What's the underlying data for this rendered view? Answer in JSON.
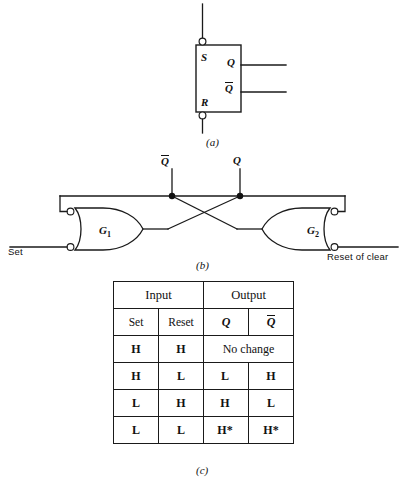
{
  "figure": {
    "panels": [
      {
        "id": "a",
        "caption": "(a)",
        "description": "SR flip-flop logic symbol"
      },
      {
        "id": "b",
        "caption": "(b)",
        "description": "Cross-coupled gate realization"
      },
      {
        "id": "c",
        "caption": "(c)",
        "description": "Truth table"
      }
    ]
  },
  "symbol": {
    "input_s": "S",
    "input_r": "R",
    "output_q": "Q",
    "output_qbar": "Q",
    "output_qbar_overbar": true
  },
  "gates": {
    "node_qbar": "Q",
    "node_q": "Q",
    "gate_left": "G",
    "gate_left_sub": "1",
    "gate_right": "G",
    "gate_right_sub": "2",
    "input_left_label": "Set",
    "input_right_label": "Reset of clear"
  },
  "table": {
    "group_headers": [
      "Input",
      "Output"
    ],
    "column_headers": [
      "Set",
      "Reset",
      "Q",
      "Q"
    ],
    "rows": [
      {
        "set": "H",
        "reset": "H",
        "q": "No change",
        "qbar": null,
        "merged": true
      },
      {
        "set": "H",
        "reset": "L",
        "q": "L",
        "qbar": "H",
        "merged": false
      },
      {
        "set": "L",
        "reset": "H",
        "q": "H",
        "qbar": "L",
        "merged": false
      },
      {
        "set": "L",
        "reset": "L",
        "q": "H*",
        "qbar": "H*",
        "merged": false
      }
    ]
  },
  "colors": {
    "ink": "#111111",
    "line": "#1a1a1a",
    "background": "#ffffff"
  }
}
